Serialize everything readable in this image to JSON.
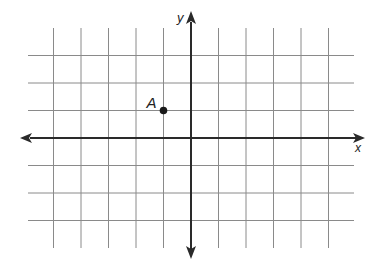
{
  "diagram": {
    "type": "coordinate-plane",
    "axes": {
      "x_label": "x",
      "y_label": "y",
      "x_range": [
        -6,
        6
      ],
      "y_range": [
        -4,
        4
      ],
      "unit_px": 27.5,
      "origin_px": [
        191,
        138
      ]
    },
    "grid": {
      "x_lines": [
        -5,
        -4,
        -3,
        -2,
        -1,
        1,
        2,
        3,
        4,
        5
      ],
      "y_lines": [
        3,
        2,
        1,
        -1,
        -2,
        -3
      ],
      "color": "#8a8a8a"
    },
    "points": [
      {
        "label": "A",
        "x": -1,
        "y": 1
      }
    ],
    "colors": {
      "axis": "#2a2a2a",
      "grid": "#8a8a8a",
      "point": "#1a1a1a"
    }
  }
}
